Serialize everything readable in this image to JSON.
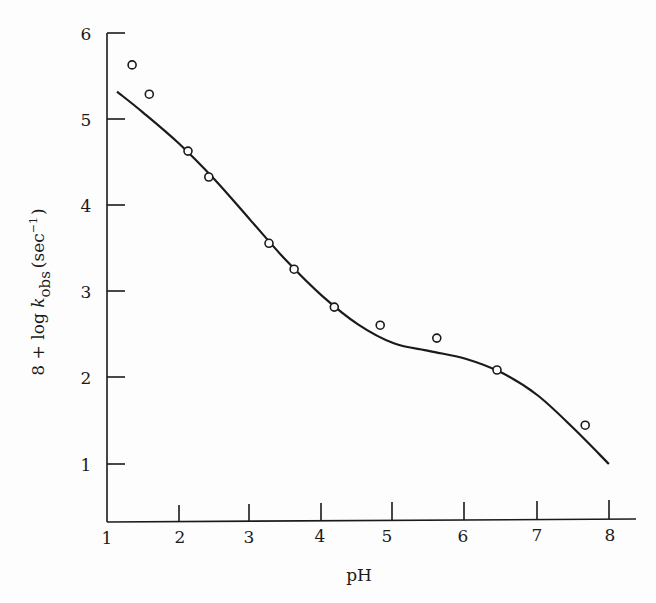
{
  "chart_data": {
    "type": "scatter",
    "title": "",
    "xlabel": "pH",
    "ylabel": {
      "prefix": "8 + log ",
      "k": "k",
      "subscript": "obs",
      "unit_open": "(sec",
      "unit_sup": "−1",
      "unit_close": ")"
    },
    "xlim": [
      1,
      8
    ],
    "ylim": [
      0.3,
      6
    ],
    "xticks": [
      "1",
      "2",
      "3",
      "4",
      "5",
      "6",
      "7",
      "8"
    ],
    "yticks": [
      "1",
      "2",
      "3",
      "4",
      "5",
      "6"
    ],
    "grid": false,
    "legend": null,
    "series": [
      {
        "name": "observed",
        "marker": "open-circle",
        "x": [
          1.35,
          1.59,
          2.13,
          2.42,
          3.26,
          3.61,
          4.17,
          4.81,
          5.6,
          6.44,
          7.67
        ],
        "y": [
          5.63,
          5.29,
          4.63,
          4.33,
          3.56,
          3.26,
          2.82,
          2.61,
          2.46,
          2.09,
          1.45
        ]
      },
      {
        "name": "fitted curve",
        "marker": "line",
        "x": [
          1.14,
          1.5,
          2.0,
          2.5,
          3.0,
          3.5,
          4.0,
          4.5,
          5.0,
          5.5,
          6.0,
          6.5,
          7.0,
          7.5,
          8.0
        ],
        "y": [
          5.32,
          5.08,
          4.72,
          4.3,
          3.83,
          3.36,
          2.95,
          2.62,
          2.4,
          2.31,
          2.22,
          2.06,
          1.8,
          1.42,
          1.0
        ]
      }
    ]
  }
}
